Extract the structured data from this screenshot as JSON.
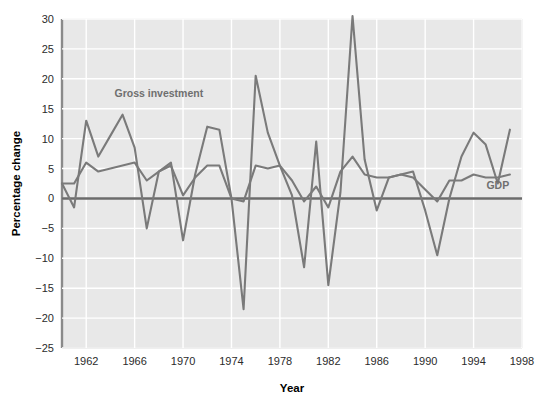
{
  "chart_data": {
    "type": "line",
    "title": "",
    "xlabel": "Year",
    "ylabel": "Percentage change",
    "xlim": [
      1960,
      1998
    ],
    "ylim": [
      -25,
      30
    ],
    "ytick_step": 5,
    "yticks": [
      30,
      25,
      20,
      15,
      10,
      5,
      0,
      -5,
      -10,
      -15,
      -20,
      -25
    ],
    "ytick_labels": [
      "30",
      "25",
      "20",
      "15",
      "10",
      "5",
      "0",
      "−5",
      "−10",
      "−15",
      "−20",
      "−25"
    ],
    "xticks": [
      1962,
      1966,
      1970,
      1974,
      1978,
      1982,
      1986,
      1990,
      1994,
      1998
    ],
    "xtick_labels": [
      "1962",
      "1966",
      "1970",
      "1974",
      "1978",
      "1982",
      "1986",
      "1990",
      "1994",
      "1998"
    ],
    "grid": true,
    "grid_color": "#ffffff",
    "plot_background": "#e8e8e8",
    "legend_position": "inline-annotations",
    "line_color": "#7a7a7a",
    "zero_line_color": "#6b6b6b",
    "x": [
      1960,
      1961,
      1962,
      1963,
      1964,
      1965,
      1966,
      1967,
      1968,
      1969,
      1970,
      1971,
      1972,
      1973,
      1974,
      1975,
      1976,
      1977,
      1978,
      1979,
      1980,
      1981,
      1982,
      1983,
      1984,
      1985,
      1986,
      1987,
      1988,
      1989,
      1990,
      1991,
      1992,
      1993,
      1994,
      1995,
      1996,
      1997
    ],
    "series": [
      {
        "name": "Gross investment",
        "label": "Gross investment",
        "label_x": 1968,
        "label_y": 17,
        "values": [
          2.5,
          -1.5,
          13.0,
          7.0,
          10.5,
          14.0,
          8.5,
          -5.0,
          4.5,
          6.0,
          -7.0,
          4.0,
          12.0,
          11.5,
          0.0,
          -18.5,
          20.5,
          11.0,
          5.5,
          0.5,
          -11.5,
          9.5,
          -14.5,
          1.0,
          30.5,
          6.5,
          -2.0,
          3.5,
          4.0,
          4.5,
          -2.0,
          -9.5,
          0.0,
          7.0,
          11.0,
          9.0,
          2.5,
          11.5
        ]
      },
      {
        "name": "GDP",
        "label": "GDP",
        "label_x": 1996,
        "label_y": 1.5,
        "values": [
          2.5,
          2.5,
          6.0,
          4.5,
          5.0,
          5.5,
          6.0,
          3.0,
          4.5,
          5.5,
          0.5,
          3.5,
          5.5,
          5.5,
          0.0,
          -0.5,
          5.5,
          5.0,
          5.5,
          3.0,
          -0.5,
          2.0,
          -1.5,
          4.5,
          7.0,
          4.0,
          3.5,
          3.5,
          4.0,
          3.5,
          1.5,
          -0.5,
          3.0,
          3.0,
          4.0,
          3.5,
          3.5,
          4.0
        ]
      }
    ]
  }
}
